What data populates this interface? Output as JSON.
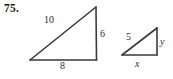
{
  "exercise": {
    "number": "75."
  },
  "figure": {
    "stroke_color": "#3a3a3a",
    "background_color": "#ffffff",
    "text_color": "#2b2b2b",
    "triangles": [
      {
        "name": "large-right-triangle",
        "labels": {
          "hypotenuse": "10",
          "vertical_leg": "6",
          "horizontal_leg": "8"
        }
      },
      {
        "name": "small-right-triangle",
        "labels": {
          "hypotenuse": "5",
          "vertical_leg": "y",
          "horizontal_leg": "x"
        }
      }
    ]
  }
}
